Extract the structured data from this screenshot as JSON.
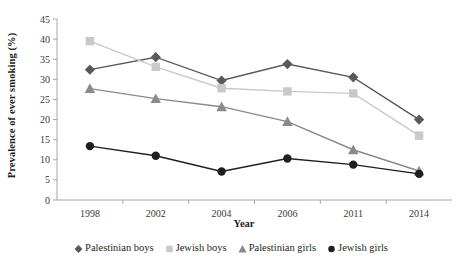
{
  "chart_data": {
    "type": "line",
    "title": "",
    "xlabel": "Year",
    "ylabel": "Prevalence of ever smoking (%)",
    "categories": [
      "1998",
      "2002",
      "2004",
      "2006",
      "2011",
      "2014"
    ],
    "ylim": [
      0,
      45
    ],
    "yticks": [
      "0",
      "5",
      "10",
      "15",
      "20",
      "25",
      "30",
      "35",
      "40",
      "45"
    ],
    "grid": false,
    "legend_position": "bottom",
    "series": [
      {
        "name": "Palestinian boys",
        "marker": "diamond",
        "color": "#595959",
        "values": [
          32.4,
          35.5,
          29.7,
          33.8,
          30.5,
          20.0
        ]
      },
      {
        "name": "Jewish boys",
        "marker": "square",
        "color": "#c9c9c9",
        "values": [
          39.5,
          33.1,
          27.8,
          27.0,
          26.5,
          16.0
        ]
      },
      {
        "name": "Palestinian girls",
        "marker": "triangle",
        "color": "#8a8a8a",
        "values": [
          27.7,
          25.2,
          23.2,
          19.5,
          12.5,
          7.2
        ]
      },
      {
        "name": "Jewish girls",
        "marker": "circle",
        "color": "#1f1f1f",
        "values": [
          13.4,
          11.0,
          7.1,
          10.3,
          8.8,
          6.5
        ]
      }
    ]
  },
  "axis": {
    "y_title": "Prevalence of ever smoking (%)",
    "x_title": "Year"
  }
}
